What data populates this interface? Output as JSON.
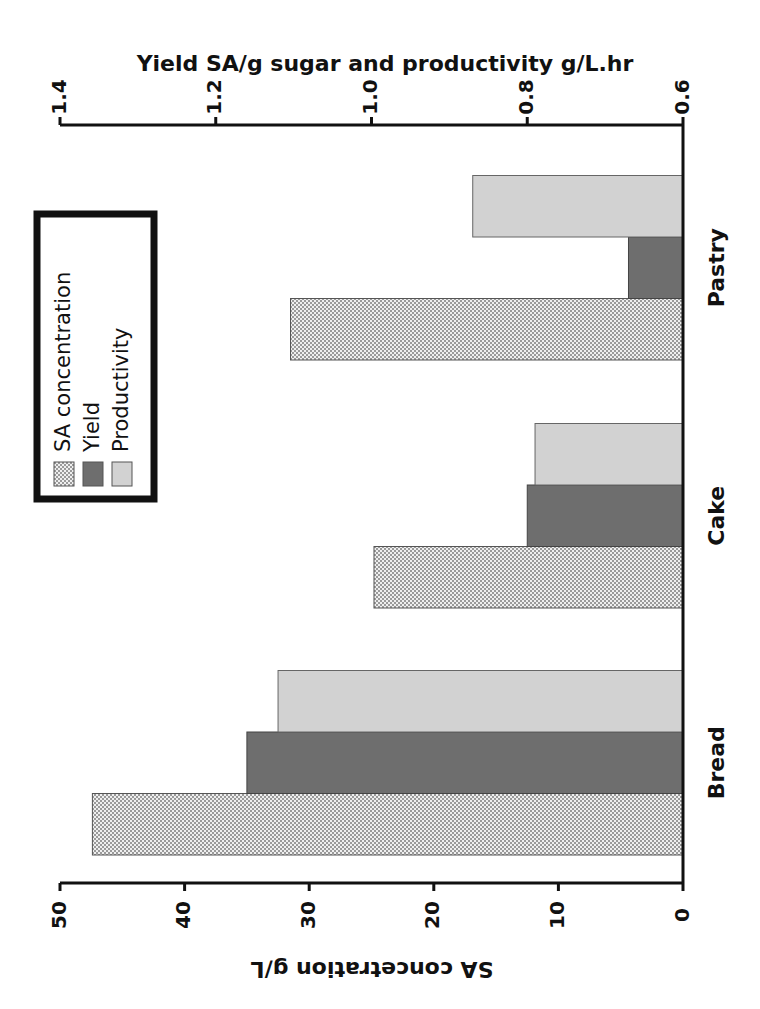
{
  "chart_data": {
    "type": "bar",
    "orientation": "horizontal-rotated-90",
    "categories": [
      "Bread",
      "Cake",
      "Pastry"
    ],
    "series": [
      {
        "name": "SA concentration",
        "axis": "bottom",
        "values": [
          47.4,
          24.8,
          31.5
        ],
        "fill": "crosshatch",
        "color": "#e0e0e0"
      },
      {
        "name": "Yield",
        "axis": "top",
        "values": [
          1.16,
          0.8,
          0.67
        ],
        "fill": "solid",
        "color": "#6e6e6e"
      },
      {
        "name": "Productivity",
        "axis": "top",
        "values": [
          1.12,
          0.79,
          0.87
        ],
        "fill": "solid",
        "color": "#d2d2d2"
      }
    ],
    "primary_axis": {
      "label": "SA concetration g/L",
      "range": [
        0,
        50
      ],
      "ticks": [
        "0",
        "10",
        "20",
        "30",
        "40",
        "50"
      ]
    },
    "secondary_axis": {
      "label": "Yield SA/g sugar and productivity g/L.hr",
      "range": [
        0.6,
        1.4
      ],
      "ticks": [
        "0.6",
        "0.8",
        "1.0",
        "1.2",
        "1.4"
      ]
    },
    "legend": {
      "position": "upper-left (rotated)",
      "entries": [
        "SA concentration",
        "Yield",
        "Productivity"
      ]
    },
    "grid": false
  }
}
